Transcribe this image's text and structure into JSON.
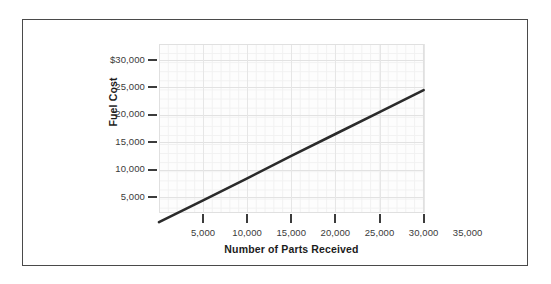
{
  "chart_data": {
    "type": "line",
    "title": "",
    "xlabel": "Number of Parts Received",
    "ylabel": "Fuel Cost",
    "xlim": [
      0,
      30000
    ],
    "ylim": [
      0,
      31000
    ],
    "grid": true,
    "legend": "none",
    "x_tick_labels": [
      "5,000",
      "10,000",
      "15,000",
      "20,000",
      "25,000",
      "30,000",
      "35,000"
    ],
    "x_tick_values": [
      5000,
      10000,
      15000,
      20000,
      25000,
      30000,
      35000
    ],
    "y_tick_labels": [
      "5,000",
      "10,000",
      "15,000",
      "20,000",
      "25,000",
      "$30,000"
    ],
    "y_tick_values": [
      5000,
      10000,
      15000,
      20000,
      25000,
      30000
    ],
    "series": [
      {
        "name": "Fuel Cost",
        "color": "#2b2b2b",
        "x": [
          0,
          5000,
          10000,
          15000,
          20000,
          25000,
          30000
        ],
        "values": [
          400,
          4400,
          8400,
          12500,
          16500,
          20500,
          24500
        ]
      }
    ],
    "annotations": []
  },
  "axes": {
    "y_title": "Fuel Cost",
    "x_title": "Number of Parts Received"
  },
  "colors": {
    "line": "#2b2b2b",
    "frame": "#4a4a4a",
    "grid_major": "#e2e2e2",
    "grid_minor": "#f1f1f1",
    "tick": "#3c3c3c",
    "text": "#3a3a3a",
    "title_text": "#1c1c1c",
    "plot_background": "#fdfdfd",
    "page_background": "#ffffff"
  }
}
